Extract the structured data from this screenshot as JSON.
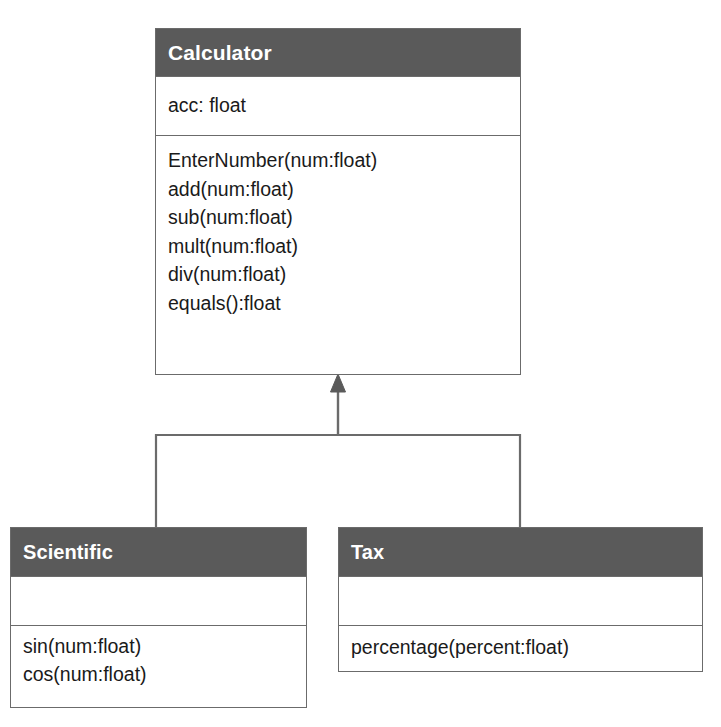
{
  "diagram": {
    "type": "uml-class-diagram",
    "relationship": "generalization",
    "line_color": "#6b6b6b",
    "header_color": "#5a5a5a",
    "header_text_color": "#ffffff",
    "background": "#ffffff",
    "classes": [
      {
        "id": "calculator",
        "name": "Calculator",
        "role": "superclass",
        "attributes": [
          "acc: float"
        ],
        "operations": [
          "EnterNumber(num:float)",
          "add(num:float)",
          "sub(num:float)",
          "mult(num:float)",
          "div(num:float)",
          "equals():float"
        ]
      },
      {
        "id": "scientific",
        "name": "Scientific",
        "role": "subclass",
        "attributes": [],
        "operations": [
          "sin(num:float)",
          "cos(num:float)"
        ]
      },
      {
        "id": "tax",
        "name": "Tax",
        "role": "subclass",
        "attributes": [],
        "operations": [
          "percentage(percent:float)"
        ]
      }
    ],
    "generalizations": [
      {
        "from": "scientific",
        "to": "calculator"
      },
      {
        "from": "tax",
        "to": "calculator"
      }
    ]
  }
}
